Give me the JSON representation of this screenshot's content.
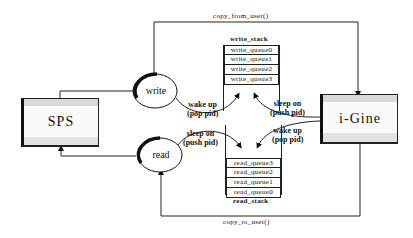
{
  "diagram": {
    "nodes": {
      "sps": {
        "label": "SPS"
      },
      "igine": {
        "label": "i-Gine"
      },
      "write": {
        "label": "write"
      },
      "read": {
        "label": "read"
      }
    },
    "write_stack": {
      "title": "write_stack",
      "rows": [
        "write_queue0",
        "write_queue1",
        "write_queue2",
        "write_queue3"
      ]
    },
    "read_stack": {
      "title": "read_stack",
      "rows": [
        "read_queue3",
        "read_queue2",
        "read_queue1",
        "read_queue0"
      ]
    },
    "edges": {
      "copy_from_user": "copy_from_user()",
      "copy_to_user": "copy_to_user()",
      "write_wake": {
        "line1": "wake up",
        "line2": "(pop pid)"
      },
      "write_sleep": {
        "line1": "sleep on",
        "line2": "(push pid)"
      },
      "read_sleep": {
        "line1": "sleep on",
        "line2": "(push pid)"
      },
      "read_wake": {
        "line1": "wake up",
        "line2": "(pop pid)"
      }
    }
  }
}
